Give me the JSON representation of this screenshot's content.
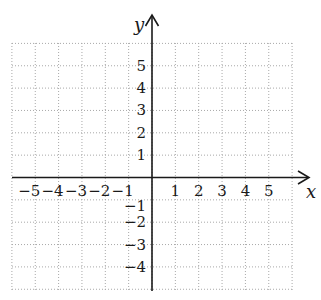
{
  "chart_data": {
    "type": "scatter",
    "title": "",
    "xlabel": "x",
    "ylabel": "y",
    "xlim": [
      -6,
      6
    ],
    "ylim": [
      -5,
      5
    ],
    "grid": true,
    "grid_style": "dotted",
    "x_tick_labels": [
      "−5",
      "−4",
      "−3",
      "−2",
      "−1",
      "1",
      "2",
      "3",
      "4",
      "5"
    ],
    "x_ticks": [
      -5,
      -4,
      -3,
      -2,
      -1,
      1,
      2,
      3,
      4,
      5
    ],
    "y_tick_labels": [
      "5",
      "4",
      "3",
      "2",
      "1",
      "−1",
      "−2",
      "−3",
      "−4"
    ],
    "y_ticks": [
      5,
      4,
      3,
      2,
      1,
      -1,
      -2,
      -3,
      -4
    ],
    "series": [],
    "legend": null
  },
  "axes": {
    "x_label": "x",
    "y_label": "y",
    "color": "#1a1a1a",
    "grid_color": "#a8a8a8"
  }
}
